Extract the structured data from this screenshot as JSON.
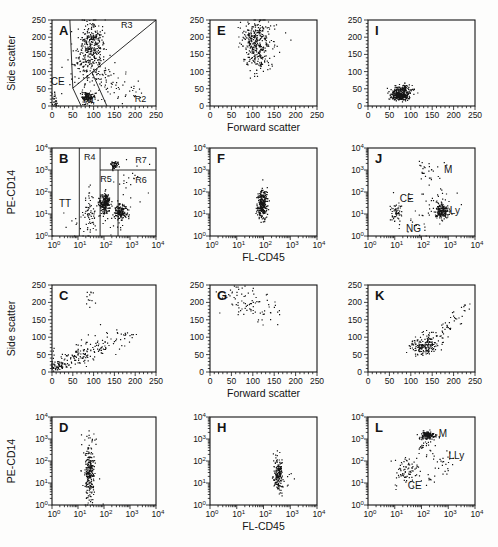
{
  "figure": {
    "background": "#fdfdfc",
    "ink": "#141414",
    "description_labels": {
      "side_scatter": "Side scatter",
      "forward_scatter": "Forward scatter",
      "pe_cd14": "PE-CD14",
      "fl_cd45": "FL-CD45"
    }
  },
  "chart_data": [
    {
      "type": "scatter",
      "letter": "A",
      "pos": {
        "left": 52,
        "top": 20,
        "width": 104,
        "height": 86
      },
      "xaxis": {
        "scale": "linear",
        "min": 0,
        "max": 250,
        "ticks": [
          0,
          50,
          100,
          150,
          200,
          250
        ],
        "minor": 10,
        "label": ""
      },
      "yaxis": {
        "scale": "linear",
        "min": 0,
        "max": 250,
        "ticks": [
          0,
          50,
          100,
          150,
          200,
          250
        ],
        "minor": 10,
        "label": "Side scatter"
      },
      "clusters": [
        [
          95,
          168,
          15,
          40,
          330
        ],
        [
          88,
          24,
          9,
          8,
          130
        ],
        [
          122,
          78,
          36,
          22,
          55
        ],
        [
          150,
          42,
          40,
          16,
          30
        ],
        [
          6,
          18,
          4,
          13,
          28
        ],
        [
          70,
          120,
          12,
          25,
          40
        ]
      ],
      "gate_lines": [
        [
          43,
          250,
          50,
          52
        ],
        [
          50,
          52,
          250,
          250
        ],
        [
          50,
          52,
          70,
          0
        ],
        [
          96,
          98,
          132,
          0
        ]
      ],
      "gate_labels": [
        {
          "text": "CE",
          "x": 14,
          "y": 60,
          "size": 10
        },
        {
          "text": "R1",
          "x": 89,
          "y": 10,
          "size": 9
        },
        {
          "text": "R2",
          "x": 213,
          "y": 13,
          "size": 9
        },
        {
          "text": "R3",
          "x": 180,
          "y": 228,
          "size": 9
        }
      ]
    },
    {
      "type": "scatter",
      "letter": "E",
      "pos": {
        "left": 210,
        "top": 20,
        "width": 107,
        "height": 86
      },
      "xaxis": {
        "scale": "linear",
        "min": 0,
        "max": 250,
        "ticks": [
          0,
          50,
          100,
          150,
          200,
          250
        ],
        "minor": 10,
        "label": "Forward scatter"
      },
      "yaxis": {
        "scale": "linear",
        "min": 0,
        "max": 250,
        "ticks": [
          0,
          50,
          100,
          150,
          200,
          250
        ],
        "minor": 10,
        "label": ""
      },
      "clusters": [
        [
          108,
          185,
          16,
          33,
          300
        ],
        [
          112,
          122,
          20,
          16,
          35
        ],
        [
          148,
          205,
          22,
          20,
          15
        ]
      ],
      "gate_lines": [],
      "gate_labels": []
    },
    {
      "type": "scatter",
      "letter": "I",
      "pos": {
        "left": 368,
        "top": 20,
        "width": 107,
        "height": 86
      },
      "xaxis": {
        "scale": "linear",
        "min": 0,
        "max": 250,
        "ticks": [
          0,
          50,
          100,
          150,
          200,
          250
        ],
        "minor": 10,
        "label": ""
      },
      "yaxis": {
        "scale": "linear",
        "min": 0,
        "max": 250,
        "ticks": [
          0,
          50,
          100,
          150,
          200,
          250
        ],
        "minor": 10,
        "label": ""
      },
      "clusters": [
        [
          76,
          29,
          10,
          6,
          240
        ],
        [
          84,
          49,
          12,
          7,
          90
        ],
        [
          78,
          38,
          17,
          11,
          60
        ]
      ],
      "gate_lines": [],
      "gate_labels": []
    },
    {
      "type": "scatter",
      "letter": "B",
      "pos": {
        "left": 52,
        "top": 148,
        "width": 104,
        "height": 88
      },
      "xaxis": {
        "scale": "log",
        "min": 0,
        "max": 4,
        "ticks": [
          0,
          1,
          2,
          3,
          4
        ],
        "label": ""
      },
      "yaxis": {
        "scale": "log",
        "min": 0,
        "max": 4,
        "ticks": [
          0,
          1,
          2,
          3,
          4
        ],
        "label": "PE-CD14"
      },
      "clusters": [
        [
          2.05,
          1.5,
          0.1,
          0.22,
          230
        ],
        [
          2.65,
          1.08,
          0.13,
          0.16,
          160
        ],
        [
          2.4,
          3.25,
          0.08,
          0.1,
          50
        ],
        [
          1.45,
          1.1,
          0.14,
          0.55,
          70
        ],
        [
          2.3,
          0.85,
          0.4,
          0.4,
          35
        ],
        [
          2.9,
          2.3,
          0.35,
          0.5,
          22
        ],
        [
          0.7,
          0.5,
          0.25,
          0.3,
          8
        ]
      ],
      "gate_lines": [
        [
          1.05,
          0,
          1.05,
          4
        ],
        [
          1.85,
          0,
          1.85,
          4
        ],
        [
          2.54,
          0,
          2.54,
          3
        ],
        [
          1.85,
          3,
          4,
          3
        ]
      ],
      "gate_labels": [
        {
          "text": "TT",
          "x": 0.5,
          "y": 1.3,
          "size": 10
        },
        {
          "text": "R4",
          "x": 1.45,
          "y": 3.45,
          "size": 9
        },
        {
          "text": "R5",
          "x": 2.08,
          "y": 2.45,
          "size": 9
        },
        {
          "text": "R6",
          "x": 3.42,
          "y": 2.4,
          "size": 9
        },
        {
          "text": "R7",
          "x": 3.42,
          "y": 3.3,
          "size": 9
        }
      ]
    },
    {
      "type": "scatter",
      "letter": "F",
      "pos": {
        "left": 210,
        "top": 148,
        "width": 107,
        "height": 88
      },
      "xaxis": {
        "scale": "log",
        "min": 0,
        "max": 4,
        "ticks": [
          0,
          1,
          2,
          3,
          4
        ],
        "label": "FL-CD45"
      },
      "yaxis": {
        "scale": "log",
        "min": 0,
        "max": 4,
        "ticks": [
          0,
          1,
          2,
          3,
          4
        ],
        "label": ""
      },
      "clusters": [
        [
          1.97,
          1.4,
          0.09,
          0.32,
          260
        ],
        [
          2.02,
          1.95,
          0.1,
          0.12,
          15
        ]
      ],
      "gate_lines": [],
      "gate_labels": []
    },
    {
      "type": "scatter",
      "letter": "J",
      "pos": {
        "left": 368,
        "top": 148,
        "width": 107,
        "height": 88
      },
      "xaxis": {
        "scale": "log",
        "min": 0,
        "max": 4,
        "ticks": [
          0,
          1,
          2,
          3,
          4
        ],
        "label": ""
      },
      "yaxis": {
        "scale": "log",
        "min": 0,
        "max": 4,
        "ticks": [
          0,
          1,
          2,
          3,
          4
        ],
        "label": ""
      },
      "clusters": [
        [
          2.78,
          1.15,
          0.13,
          0.18,
          170
        ],
        [
          1.05,
          1.05,
          0.12,
          0.22,
          55
        ],
        [
          2.3,
          2.9,
          0.3,
          0.35,
          28
        ],
        [
          2.0,
          0.6,
          0.35,
          0.28,
          16
        ],
        [
          2.5,
          1.7,
          0.45,
          0.35,
          25
        ]
      ],
      "gate_lines": [],
      "gate_labels": [
        {
          "text": "M",
          "x": 3.0,
          "y": 2.85,
          "size": 10
        },
        {
          "text": "CE",
          "x": 1.45,
          "y": 1.55,
          "size": 10
        },
        {
          "text": "Ly",
          "x": 3.25,
          "y": 1.0,
          "size": 10
        },
        {
          "text": "NG",
          "x": 1.7,
          "y": 0.2,
          "size": 10
        }
      ]
    },
    {
      "type": "scatter",
      "letter": "C",
      "pos": {
        "left": 52,
        "top": 285,
        "width": 104,
        "height": 87
      },
      "xaxis": {
        "scale": "linear",
        "min": 0,
        "max": 250,
        "ticks": [
          0,
          50,
          100,
          150,
          200,
          250
        ],
        "minor": 10,
        "label": ""
      },
      "yaxis": {
        "scale": "linear",
        "min": 0,
        "max": 250,
        "ticks": [
          0,
          50,
          100,
          150,
          200,
          250
        ],
        "minor": 10,
        "label": "Side scatter"
      },
      "clusters": [
        [
          20,
          17,
          12,
          8,
          55
        ],
        [
          60,
          43,
          18,
          12,
          75
        ],
        [
          103,
          68,
          20,
          13,
          55
        ],
        [
          148,
          95,
          26,
          13,
          25
        ],
        [
          100,
          218,
          13,
          17,
          12
        ],
        [
          4,
          28,
          3,
          18,
          12
        ],
        [
          195,
          112,
          18,
          9,
          7
        ]
      ],
      "gate_lines": [],
      "gate_labels": []
    },
    {
      "type": "scatter",
      "letter": "G",
      "pos": {
        "left": 210,
        "top": 285,
        "width": 107,
        "height": 87
      },
      "xaxis": {
        "scale": "linear",
        "min": 0,
        "max": 250,
        "ticks": [
          0,
          50,
          100,
          150,
          200,
          250
        ],
        "minor": 10,
        "label": "Forward scatter"
      },
      "yaxis": {
        "scale": "linear",
        "min": 0,
        "max": 250,
        "ticks": [
          0,
          50,
          100,
          150,
          200,
          250
        ],
        "minor": 10,
        "label": ""
      },
      "clusters": [
        [
          85,
          205,
          30,
          22,
          55
        ],
        [
          120,
          168,
          26,
          18,
          22
        ],
        [
          60,
          232,
          14,
          10,
          10
        ]
      ],
      "gate_lines": [],
      "gate_labels": []
    },
    {
      "type": "scatter",
      "letter": "K",
      "pos": {
        "left": 368,
        "top": 285,
        "width": 107,
        "height": 87
      },
      "xaxis": {
        "scale": "linear",
        "min": 0,
        "max": 250,
        "ticks": [
          0,
          50,
          100,
          150,
          200,
          250
        ],
        "minor": 10,
        "label": ""
      },
      "yaxis": {
        "scale": "linear",
        "min": 0,
        "max": 250,
        "ticks": [
          0,
          50,
          100,
          150,
          200,
          250
        ],
        "minor": 10,
        "label": ""
      },
      "clusters": [
        [
          130,
          72,
          15,
          11,
          150
        ],
        [
          155,
          95,
          12,
          10,
          28
        ],
        [
          185,
          128,
          11,
          9,
          15
        ],
        [
          210,
          158,
          10,
          9,
          12
        ],
        [
          233,
          183,
          8,
          8,
          8
        ],
        [
          148,
          112,
          14,
          9,
          10
        ]
      ],
      "gate_lines": [],
      "gate_labels": []
    },
    {
      "type": "scatter",
      "letter": "D",
      "pos": {
        "left": 52,
        "top": 417,
        "width": 104,
        "height": 88
      },
      "xaxis": {
        "scale": "log",
        "min": 0,
        "max": 4,
        "ticks": [
          0,
          1,
          2,
          3,
          4
        ],
        "label": ""
      },
      "yaxis": {
        "scale": "log",
        "min": 0,
        "max": 4,
        "ticks": [
          0,
          1,
          2,
          3,
          4
        ],
        "label": "PE-CD14"
      },
      "clusters": [
        [
          1.45,
          1.5,
          0.09,
          0.68,
          240
        ],
        [
          1.5,
          1.3,
          0.18,
          0.85,
          25
        ]
      ],
      "gate_lines": [],
      "gate_labels": []
    },
    {
      "type": "scatter",
      "letter": "H",
      "pos": {
        "left": 210,
        "top": 417,
        "width": 107,
        "height": 88
      },
      "xaxis": {
        "scale": "log",
        "min": 0,
        "max": 4,
        "ticks": [
          0,
          1,
          2,
          3,
          4
        ],
        "label": "FL-CD45"
      },
      "yaxis": {
        "scale": "log",
        "min": 0,
        "max": 4,
        "ticks": [
          0,
          1,
          2,
          3,
          4
        ],
        "label": ""
      },
      "clusters": [
        [
          2.55,
          1.35,
          0.08,
          0.33,
          170
        ],
        [
          2.62,
          2.2,
          0.13,
          0.22,
          12
        ],
        [
          2.75,
          1.05,
          0.22,
          0.25,
          10
        ]
      ],
      "gate_lines": [],
      "gate_labels": []
    },
    {
      "type": "scatter",
      "letter": "L",
      "pos": {
        "left": 368,
        "top": 417,
        "width": 107,
        "height": 88
      },
      "xaxis": {
        "scale": "log",
        "min": 0,
        "max": 4,
        "ticks": [
          0,
          1,
          2,
          3,
          4
        ],
        "label": ""
      },
      "yaxis": {
        "scale": "log",
        "min": 0,
        "max": 4,
        "ticks": [
          0,
          1,
          2,
          3,
          4
        ],
        "label": ""
      },
      "clusters": [
        [
          2.25,
          3.15,
          0.13,
          0.1,
          130
        ],
        [
          2.15,
          2.65,
          0.18,
          0.22,
          25
        ],
        [
          1.5,
          1.5,
          0.22,
          0.3,
          70
        ],
        [
          2.85,
          2.0,
          0.25,
          0.3,
          25
        ],
        [
          2.4,
          1.05,
          0.2,
          0.18,
          8
        ],
        [
          1.15,
          1.4,
          0.1,
          0.25,
          10
        ]
      ],
      "gate_lines": [],
      "gate_labels": [
        {
          "text": "M",
          "x": 2.8,
          "y": 3.1,
          "size": 10
        },
        {
          "text": "LLy",
          "x": 3.3,
          "y": 2.1,
          "size": 10
        },
        {
          "text": "CE",
          "x": 1.75,
          "y": 0.75,
          "size": 10
        }
      ]
    }
  ]
}
